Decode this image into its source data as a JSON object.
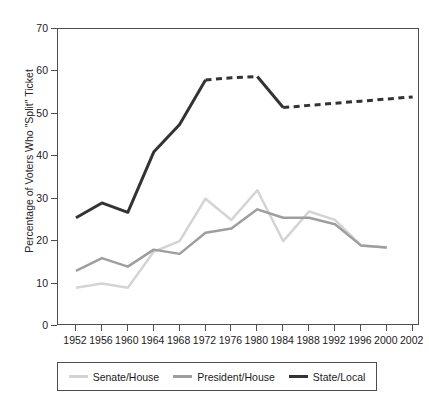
{
  "chart_data": {
    "type": "line",
    "title": "",
    "xlabel": "",
    "ylabel": "Percentage of Voters Who \"Split\" Ticket",
    "xlim": [
      1950,
      2004
    ],
    "ylim": [
      0,
      70
    ],
    "yticks": [
      0,
      10,
      20,
      30,
      40,
      50,
      60,
      70
    ],
    "grid": false,
    "legend_position": "bottom",
    "categories": [
      1952,
      1956,
      1960,
      1964,
      1968,
      1972,
      1976,
      1980,
      1984,
      1988,
      1992,
      1996,
      2000,
      2002
    ],
    "series": [
      {
        "name": "Senate/House",
        "color": "#d4d4d4",
        "width": 2.5,
        "x": [
          1952,
          1956,
          1960,
          1964,
          1968,
          1972,
          1976,
          1980,
          1984,
          1988,
          1992,
          1996,
          2000
        ],
        "values": [
          9,
          10,
          9,
          17.5,
          20,
          30,
          25,
          32,
          20,
          27,
          25,
          19,
          18.5
        ]
      },
      {
        "name": "President/House",
        "color": "#9e9e9e",
        "width": 2.5,
        "x": [
          1952,
          1956,
          1960,
          1964,
          1968,
          1972,
          1976,
          1980,
          1984,
          1988,
          1992,
          1996,
          2000
        ],
        "values": [
          13,
          16,
          14,
          18,
          17,
          22,
          23,
          27.5,
          25.5,
          25.5,
          24,
          19,
          18.5
        ]
      },
      {
        "name": "State/Local",
        "color": "#333333",
        "width": 3,
        "x": [
          1952,
          1956,
          1960,
          1964,
          1968,
          1972,
          1976,
          1980,
          1984,
          1988,
          1992,
          1996,
          2000,
          2002
        ],
        "values": [
          25.5,
          29,
          26.8,
          41,
          47.5,
          58,
          58.5,
          58.8,
          51.5,
          52,
          52.5,
          53,
          53.5,
          54
        ],
        "dashed_segments": [
          [
            1972,
            1980
          ],
          [
            1984,
            2002
          ]
        ],
        "solid_segments": [
          [
            1952,
            1972
          ],
          [
            1980,
            1984
          ]
        ]
      }
    ],
    "legend": [
      {
        "label": "Senate/House",
        "color": "#d4d4d4"
      },
      {
        "label": "President/House",
        "color": "#9e9e9e"
      },
      {
        "label": "State/Local",
        "color": "#333333"
      }
    ],
    "xtick_labels": [
      "1952",
      "1956",
      "1960",
      "1964",
      "1968",
      "1972",
      "1976",
      "1980",
      "1984",
      "1988",
      "1992",
      "1996",
      "2000",
      "2002"
    ],
    "ytick_labels": [
      "0",
      "10",
      "20",
      "30",
      "40",
      "50",
      "60",
      "70"
    ]
  }
}
